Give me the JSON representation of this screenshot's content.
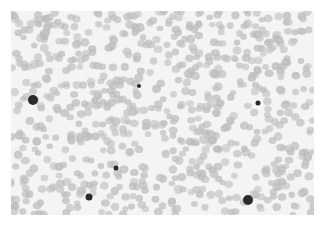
{
  "image": {
    "description": "Grayscale microscopy image of a blood smear showing densely packed red blood cells with a few dark-stained cells",
    "colors": {
      "background": "#ffffff",
      "field": "#f4f4f4",
      "rbc": "#bdbdbd",
      "rbc_center": "#d2d2d2",
      "dark_cell": "#2a2a2a"
    },
    "dark_cells": [
      {
        "x": 33,
        "y": 100,
        "r": 5
      },
      {
        "x": 248,
        "y": 200,
        "r": 5
      },
      {
        "x": 89,
        "y": 197,
        "r": 3.5
      },
      {
        "x": 116,
        "y": 168,
        "r": 2.5
      },
      {
        "x": 139,
        "y": 86,
        "r": 2
      },
      {
        "x": 258,
        "y": 103,
        "r": 2.5
      }
    ]
  }
}
